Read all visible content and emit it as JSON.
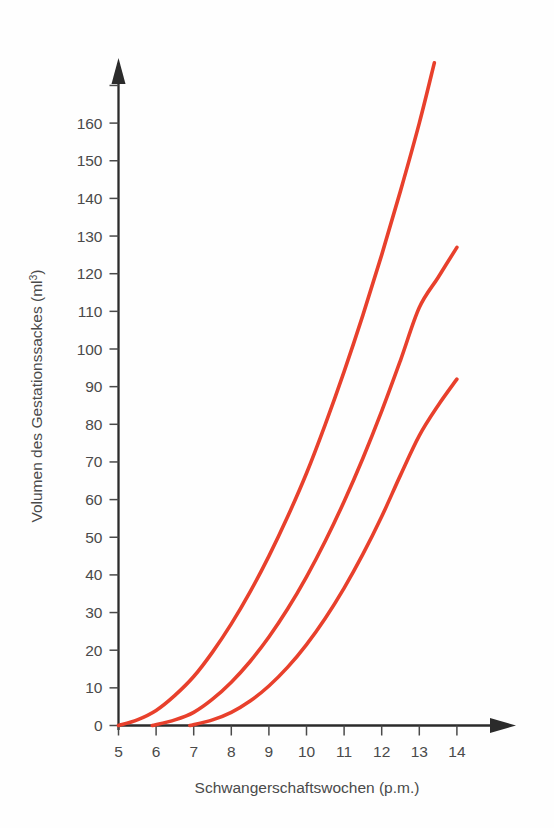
{
  "chart_data": {
    "type": "line",
    "title": "",
    "xlabel": "Schwangerschaftswochen (p.m.)",
    "ylabel": "Volumen des Gestationssackes (ml³)",
    "ylabel_base": "Volumen des Gestationssackes (ml",
    "ylabel_sup": "3",
    "ylabel_close": ")",
    "xlim": [
      5,
      14
    ],
    "ylim": [
      0,
      170
    ],
    "xticks": [
      5,
      6,
      7,
      8,
      9,
      10,
      11,
      12,
      13,
      14
    ],
    "xtick_labels": [
      "5",
      "6",
      "7",
      "8",
      "9",
      "10",
      "11",
      "12",
      "13",
      "14"
    ],
    "yticks": [
      0,
      10,
      20,
      30,
      40,
      50,
      60,
      70,
      80,
      90,
      100,
      110,
      120,
      130,
      140,
      150,
      160,
      170
    ],
    "ytick_labels": [
      "0",
      "10",
      "20",
      "30",
      "40",
      "50",
      "60",
      "70",
      "80",
      "90",
      "100",
      "110",
      "120",
      "130",
      "140",
      "150",
      "160",
      "170"
    ],
    "ytick_labels_shown": [
      "0",
      "10",
      "20",
      "30",
      "40",
      "50",
      "60",
      "70",
      "80",
      "90",
      "100",
      "110",
      "120",
      "130",
      "140",
      "150",
      "160"
    ],
    "grid": false,
    "legend": "none",
    "axis_style": "arrow-terminated",
    "series_color": "#E8402C",
    "series": [
      {
        "name": "obere Kurve",
        "color": "#E8402C",
        "x": [
          5.0,
          5.5,
          6.0,
          6.5,
          7.0,
          7.5,
          8.0,
          8.5,
          9.0,
          9.5,
          10.0,
          10.5,
          11.0,
          11.5,
          12.0,
          12.5,
          13.0,
          13.4
        ],
        "values": [
          0,
          1.5,
          4,
          8,
          13,
          19.5,
          27,
          35.5,
          45,
          55.5,
          67,
          80,
          94,
          109,
          125,
          142,
          160,
          176
        ]
      },
      {
        "name": "mittlere Kurve",
        "color": "#E8402C",
        "x": [
          5.9,
          6.5,
          7.0,
          7.5,
          8.0,
          8.5,
          9.0,
          9.5,
          10.0,
          10.5,
          11.0,
          11.5,
          12.0,
          12.5,
          13.0,
          13.5,
          14.0
        ],
        "values": [
          0,
          1.5,
          3.5,
          7,
          11.5,
          17,
          23.5,
          31,
          39.5,
          49,
          59.5,
          71,
          83.5,
          97,
          111,
          119,
          127
        ]
      },
      {
        "name": "untere Kurve",
        "color": "#E8402C",
        "x": [
          6.9,
          7.5,
          8.0,
          8.5,
          9.0,
          9.5,
          10.0,
          10.5,
          11.0,
          11.5,
          12.0,
          12.5,
          13.0,
          13.5,
          14.0
        ],
        "values": [
          0,
          1.5,
          3.5,
          6.5,
          10.5,
          15.5,
          21.5,
          28.5,
          36.5,
          45.5,
          55.5,
          66.5,
          77,
          85,
          92
        ]
      }
    ]
  }
}
